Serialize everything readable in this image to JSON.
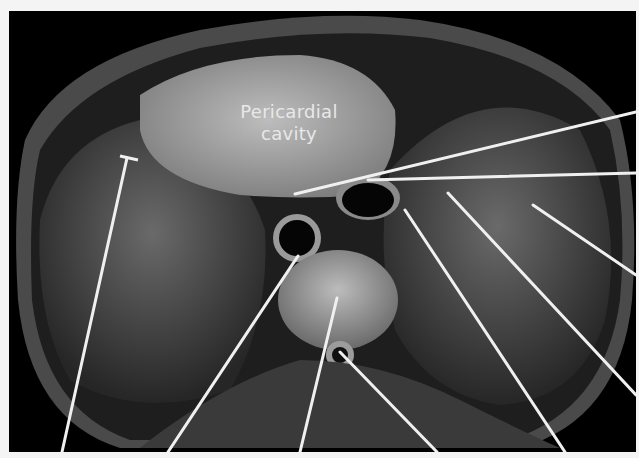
{
  "figure": {
    "labels": [
      {
        "text_line1": "Pericardial",
        "text_line2": "cavity",
        "x": 270,
        "y": 102
      }
    ],
    "leader_lines": [
      {
        "x1": 636,
        "y1": 112,
        "x2": 295,
        "y2": 194
      },
      {
        "x1": 636,
        "y1": 173,
        "x2": 368,
        "y2": 180
      },
      {
        "x1": 636,
        "y1": 275,
        "x2": 533,
        "y2": 205
      },
      {
        "x1": 636,
        "y1": 395,
        "x2": 448,
        "y2": 193
      },
      {
        "x1": 565,
        "y1": 452,
        "x2": 405,
        "y2": 210
      },
      {
        "x1": 437,
        "y1": 452,
        "x2": 340,
        "y2": 352
      },
      {
        "x1": 300,
        "y1": 452,
        "x2": 337,
        "y2": 298
      },
      {
        "x1": 168,
        "y1": 452,
        "x2": 298,
        "y2": 256
      },
      {
        "x1": 62,
        "y1": 452,
        "x2": 127,
        "y2": 158
      }
    ],
    "colors": {
      "background": "#000000",
      "line": "#f0f0f0",
      "margin": "#f4f4f4"
    }
  }
}
